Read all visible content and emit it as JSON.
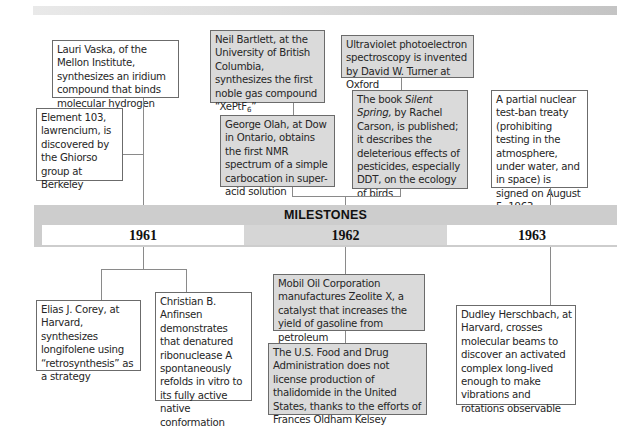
{
  "band": {
    "title": "MILESTONES",
    "years": [
      "1961",
      "1962",
      "1963"
    ]
  },
  "events_above": {
    "1961": [
      {
        "id": "vaska",
        "text": "Lauri Vaska, of the Mellon Institute, synthesizes an iridium compound that binds molecular hydrogen",
        "shaded": false
      },
      {
        "id": "lawrencium",
        "text": "Element 103, lawrencium, is discovered by the Ghiorso group at Berkeley",
        "shaded": false
      }
    ],
    "1962": [
      {
        "id": "bartlett",
        "text_before": "Neil Bartlett, at the University of British Columbia, synthesizes the first noble gas compound “XePtF",
        "subscript": "6",
        "text_after": "”",
        "shaded": true
      },
      {
        "id": "olah",
        "text": "George Olah, at Dow in Ontario, obtains the first NMR spectrum of a simple carbocation in super-acid solution",
        "shaded": true
      },
      {
        "id": "turner",
        "text": "Ultraviolet photoelectron spectroscopy is invented by David W. Turner at Oxford",
        "shaded": true
      },
      {
        "id": "carson",
        "text_before": "The book ",
        "italic": "Silent Spring,",
        "text_after": " by Rachel Carson, is published; it describes the deleterious effects of pesticides, especially DDT, on the ecology of birds",
        "shaded": true
      }
    ],
    "1963": [
      {
        "id": "test-ban",
        "text": "A partial nuclear test-ban treaty (prohibiting testing in the atmosphere, under water, and in space) is signed on August 5, 1963",
        "shaded": false
      }
    ]
  },
  "events_below": {
    "1961": [
      {
        "id": "corey",
        "text": "Elias J. Corey, at Harvard, synthesizes longifolene using “retrosynthesis” as a strategy",
        "shaded": false
      },
      {
        "id": "anfinsen",
        "text": "Christian B. Anfinsen demonstrates that denatured ribonuclease A spontaneously refolds in vitro to its fully active native conformation",
        "shaded": false
      }
    ],
    "1962": [
      {
        "id": "mobil",
        "text": "Mobil Oil Corporation manufactures Zeolite X, a catalyst that increases the yield of gasoline from petroleum",
        "shaded": true
      },
      {
        "id": "fda",
        "text": "The U.S. Food and Drug Administration does not license production of thalidomide in the United States, thanks to the efforts of Frances Oldham Kelsey",
        "shaded": true
      }
    ],
    "1963": [
      {
        "id": "herschbach",
        "text": "Dudley Herschbach, at Harvard, crosses molecular beams to discover an activated complex long-lived enough to make vibrations and rotations observable",
        "shaded": false
      }
    ]
  },
  "colors": {
    "shaded_box": "#dadada",
    "band": "#cdcdcd",
    "border": "#6b6b6b",
    "connector": "#8a8a8a"
  }
}
